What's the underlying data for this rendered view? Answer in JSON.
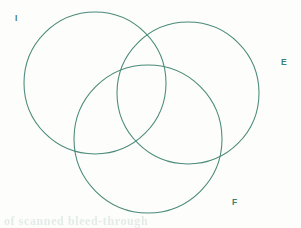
{
  "figure": {
    "kind": "venn-diagram",
    "background_color": "#fdfdfc",
    "stroke_color": "#4a8a79",
    "label_color": "#3f7f70",
    "width": 301,
    "height": 228
  },
  "sets": [
    {
      "id": "I",
      "label": "I",
      "name": "circle-i",
      "cx": 95,
      "cy": 83,
      "r": 71
    },
    {
      "id": "E",
      "label": "E",
      "name": "circle-e",
      "cx": 188,
      "cy": 93,
      "r": 71
    },
    {
      "id": "F",
      "label": "F",
      "name": "circle-f",
      "cx": 148,
      "cy": 139,
      "r": 74
    }
  ],
  "artifacts": {
    "ghost_text": "of scanned bleed-through"
  }
}
